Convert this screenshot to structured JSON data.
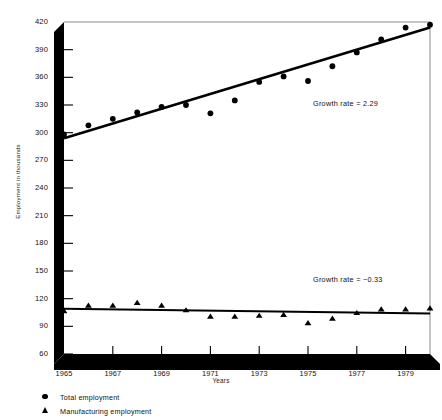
{
  "chart_data": {
    "type": "scatter",
    "title": "",
    "xlabel": "Years",
    "ylabel": "Employment in thousands",
    "xlim": [
      1965,
      1980
    ],
    "ylim": [
      60,
      420
    ],
    "yticks": [
      60,
      90,
      120,
      150,
      180,
      210,
      240,
      270,
      300,
      330,
      360,
      390,
      420
    ],
    "ytick_labels": [
      "60",
      "90",
      "120",
      "150",
      "180",
      "210",
      "240",
      "270",
      "300",
      "330",
      "360",
      "390",
      "420"
    ],
    "xticks": [
      1965,
      1967,
      1969,
      1971,
      1973,
      1975,
      1977,
      1979
    ],
    "xtick_labels": [
      "1965",
      "1967",
      "1969",
      "1971",
      "1973",
      "1975",
      "1977",
      "1979"
    ],
    "grid": false,
    "legend_position": "below-plot",
    "x": [
      1965,
      1966,
      1967,
      1968,
      1969,
      1970,
      1971,
      1972,
      1973,
      1974,
      1975,
      1976,
      1977,
      1978,
      1979,
      1980
    ],
    "series": [
      {
        "name": "Total employment",
        "marker": "circle",
        "values": [
          298,
          308,
          315,
          322,
          328,
          330,
          321,
          335,
          355,
          361,
          356,
          372,
          387,
          401,
          414,
          417
        ],
        "trend": {
          "label": "Growth rate  =  2.29",
          "growth_rate": 2.29,
          "y_start": 294,
          "y_end": 414
        }
      },
      {
        "name": "Manufacturing employment",
        "marker": "triangle",
        "values": [
          107,
          113,
          113,
          116,
          113,
          108,
          101,
          101,
          102,
          103,
          94,
          99,
          105,
          109,
          109,
          110
        ],
        "trend": {
          "label": "Growth rate  =  −0.33",
          "growth_rate": -0.33,
          "y_start": 109,
          "y_end": 104
        }
      }
    ],
    "annotations": [
      {
        "text": "Growth rate  =  2.29",
        "x": 1975.2,
        "y": 330
      },
      {
        "text": "Growth rate  =  −0.33",
        "x": 1975.2,
        "y": 140
      }
    ],
    "legend_entries": [
      {
        "marker": "circle",
        "label": "Total employment"
      },
      {
        "marker": "triangle",
        "label": "Manufacturing employment"
      }
    ],
    "colors": {
      "marker": "#000000",
      "trendline": "#000000",
      "axis": "#000000",
      "plot_background": "#ffffff"
    }
  }
}
